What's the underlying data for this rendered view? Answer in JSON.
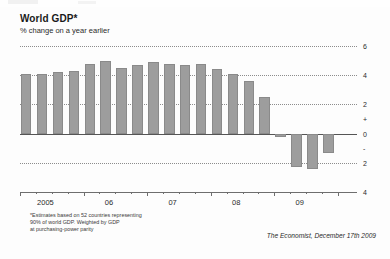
{
  "header": {
    "title": "World GDP*",
    "subtitle": "% change on a year earlier"
  },
  "footnote": "*Estimates based on 52 countries representing\n90% of world GDP. Weighted by GDP\nat purchasing-power parity",
  "source": "The Economist, December 17th 2009",
  "colors": {
    "bar": "#9d9d9d",
    "bar_border": "#8a8a8a",
    "gridline": "#8c8c8c",
    "zero_line": "#555555",
    "text": "#231f20",
    "background": "#fdfdfd"
  },
  "axis": {
    "y_ticks": [
      "6",
      "4",
      "2",
      "+",
      "0",
      "-",
      "2",
      "4"
    ],
    "y_tick_values": [
      6,
      4,
      2,
      null,
      0,
      null,
      -2,
      -4
    ],
    "x_ticks": [
      "2005",
      "06",
      "07",
      "08",
      "09"
    ]
  },
  "chart_data": {
    "type": "bar",
    "title": "World GDP*",
    "subtitle": "% change on a year earlier",
    "xlabel": "",
    "ylabel": "% change on a year earlier",
    "ylim": [
      -4,
      6
    ],
    "grid": true,
    "legend": "none",
    "categories": [
      "2005 Q1",
      "2005 Q2",
      "2005 Q3",
      "2005 Q4",
      "2006 Q1",
      "2006 Q2",
      "2006 Q3",
      "2006 Q4",
      "2007 Q1",
      "2007 Q2",
      "2007 Q3",
      "2007 Q4",
      "2008 Q1",
      "2008 Q2",
      "2008 Q3",
      "2008 Q4",
      "2009 Q1",
      "2009 Q2",
      "2009 Q3"
    ],
    "values": [
      4.1,
      4.1,
      4.2,
      4.3,
      4.8,
      5.0,
      4.5,
      4.7,
      4.9,
      4.8,
      4.7,
      4.8,
      4.4,
      4.1,
      3.6,
      2.5,
      -0.2,
      -2.3,
      -2.4
    ],
    "values_tail": [
      -1.3
    ],
    "axis_ranges": {
      "y_min": -4,
      "y_max": 6
    },
    "x_tick_labels": [
      "2005",
      "06",
      "07",
      "08",
      "09"
    ]
  }
}
